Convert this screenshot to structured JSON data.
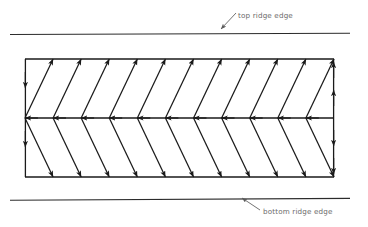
{
  "figure": {
    "type": "chevron-flow-diagram",
    "background_color": "#ffffff",
    "stroke_color": "#1a1a1a",
    "label_color": "#6b6b6b",
    "width": 368,
    "height": 227
  },
  "annotations": [
    {
      "id": "top-ridge-edge",
      "text": "top ridge edge",
      "x": 238,
      "y": 11,
      "leader": {
        "x1": 236,
        "y1": 14,
        "x2": 220,
        "y2": 30
      }
    },
    {
      "id": "bottom-ridge-edge",
      "text": "bottom ridge edge",
      "x": 263,
      "y": 207,
      "leader": {
        "x1": 261,
        "y1": 210,
        "x2": 241,
        "y2": 197
      }
    }
  ],
  "ridge_edges": [
    {
      "id": "top-ridge-line",
      "x1": 10,
      "y1": 34,
      "x2": 350,
      "y2": 33
    },
    {
      "id": "bottom-ridge-line",
      "x1": 10,
      "y1": 200,
      "x2": 350,
      "y2": 198
    }
  ],
  "chart_data": {
    "type": "diagram",
    "title": "",
    "panel": {
      "left": 25,
      "top": 59,
      "right": 334,
      "bottom": 177,
      "mid_y": 118
    },
    "chevron_count": 11,
    "chevron_spacing": 28.1,
    "chevron_direction": "left",
    "spine": {
      "label": "center spine",
      "y": 118,
      "arrow_direction": "left",
      "arrow_count": 11
    },
    "top_edge_arrows": {
      "count": 11,
      "direction": "up-right"
    },
    "bottom_edge_arrows": {
      "count": 11,
      "direction": "down-right"
    },
    "left_edge_arrows": {
      "count": 2,
      "direction": "down",
      "positions_y": [
        88,
        147
      ]
    },
    "right_edge_arrows": {
      "count": 4,
      "directions": [
        "up",
        "up",
        "down",
        "down"
      ],
      "positions_y": [
        62,
        90,
        146,
        174
      ]
    }
  }
}
